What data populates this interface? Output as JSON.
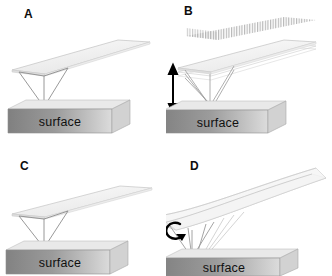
{
  "figure": {
    "type": "scientific-diagram",
    "background_color": "#ffffff",
    "panels": [
      {
        "id": "A",
        "label": "A",
        "mode": "contact-mode-cantilever",
        "surface_label": "surface",
        "cantilever": "flat-beam",
        "tip": "pyramidal-tip-touching-surface",
        "annotation": "none"
      },
      {
        "id": "B",
        "label": "B",
        "mode": "oscillating-tapping-mode-cantilever",
        "surface_label": "surface",
        "cantilever": "multiple-blurred-beams-vibrating",
        "tip": "pyramidal-tip-oscillating",
        "annotation": "vertical-double-headed-arrow",
        "motion_blur": "striped-vibration-trace-above-beam"
      },
      {
        "id": "C",
        "label": "C",
        "mode": "contact-mode-cantilever",
        "surface_label": "surface",
        "cantilever": "flat-beam",
        "tip": "pyramidal-tip-touching-surface",
        "annotation": "none"
      },
      {
        "id": "D",
        "label": "D",
        "mode": "torsional-lateral-force-mode-cantilever",
        "surface_label": "surface",
        "cantilever": "twisted-beam",
        "tip": "pyramidal-tip-twisting",
        "annotation": "curved-rotation-arrow"
      }
    ],
    "colors": {
      "label_text": "#0d0d0d",
      "surface_text": "#101010",
      "surface_top_face": "#e8e8e8",
      "surface_front_dark": "#7f7f7f",
      "surface_front_light": "#d8d8d8",
      "cantilever_fill": "#f2f2f2",
      "cantilever_edge": "#b9b9b9",
      "tip_edge": "#8a8a8a",
      "arrow": "#000000"
    }
  }
}
